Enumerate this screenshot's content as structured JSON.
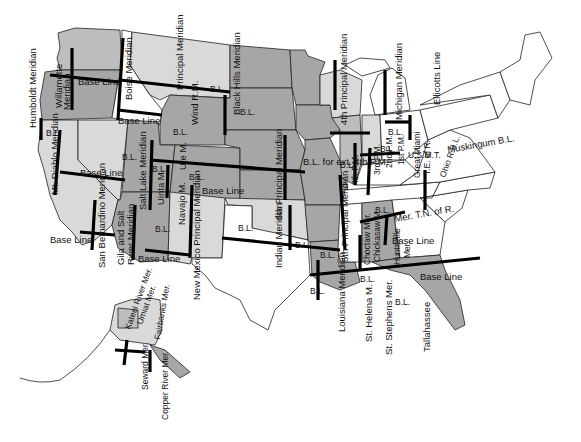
{
  "map": {
    "title": "Principal Meridians and Base Lines of the United States",
    "colors": {
      "dark_gray": "#a6a6a6",
      "medium_gray": "#bdbdbd",
      "light_gray": "#d9d9d9",
      "line": "#000000",
      "background": "#ffffff"
    },
    "meridian_labels": {
      "humboldt": "Humboldt Meridian",
      "willamette": "Willamette",
      "willamette2": "Meridian",
      "boise": "Boise Meridian",
      "principal": "Principal Meridian",
      "wind_river": "Wind R.M.",
      "black_hills": "Black Hills Meridian",
      "fourth_pm": "4th Principal Meridian",
      "michigan": "Michigan Meridian",
      "ellicotts": "Ellicotts Line",
      "mt_diablo": "Mt. Diablo Meridian",
      "salt_lake": "Salt Lake Meridian",
      "uinta": "Uinta M.",
      "ute": "Ute M.",
      "navajo": "Navajo M.",
      "san_bernardino": "San Bernardino Meridian",
      "gila_salt": "Gila and Salt",
      "gila_salt2": "River Meridian",
      "nm_principal": "New Mexico Principal Meridian",
      "sixth_pm": "6th Principal Meridian",
      "indian": "Indian Meridian",
      "fifth_pm": "5th Principal Meridian",
      "wash_m": "Wash.M.",
      "fourth_pm_small": "4th P.M.",
      "third_pm": "3rd P.M.",
      "second_pm": "2nd P.M.",
      "first_pm": "1st P.M.",
      "great_miami": "Great Miami",
      "te_of_r": "T.E. of R.",
      "ohio_rbl": "Ohio R.B.L.",
      "mer_tn": "Mer. T.N. of R.",
      "choctaw": "Choctaw Mer.",
      "chickasaw": "Chickasaw M.",
      "huntsville": "Huntsville",
      "huntsville2": "Mer.",
      "louisiana": "Louisiana Meridian",
      "st_helena": "St. Helena M.",
      "st_stephens": "St. Stephens Mer.",
      "tallahassee": "Tallahassee",
      "kateel": "Kateel River Mer.",
      "umiat": "Umiat Mer.",
      "fairbanks": "Fairbanks Mer.",
      "seward": "Seward Mer.",
      "copper_river": "Copper River Mer."
    },
    "baseline_labels": {
      "bl": "B.L.",
      "base_line": "Base Line",
      "bl_ext_4pm": "B.L. for ext. 4th P.M.",
      "usmt": "U.S.M.T.",
      "muskingum": "Muskingum B.L."
    }
  }
}
